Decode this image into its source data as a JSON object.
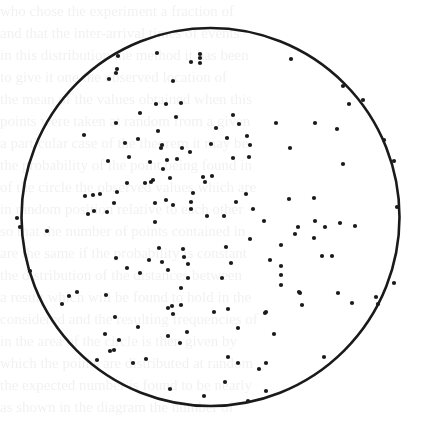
{
  "figure": {
    "circle": {
      "cx": 210.5,
      "cy": 217,
      "r": 189,
      "stroke": "#1a1a1a",
      "stroke_width": 2.6
    },
    "dot_color": "#1a1a1a",
    "dot_radius": 2.1,
    "points": [
      [
        118,
        56
      ],
      [
        117,
        69
      ],
      [
        116,
        73
      ],
      [
        109,
        79
      ],
      [
        157,
        53
      ],
      [
        191,
        62
      ],
      [
        200,
        54
      ],
      [
        200,
        58
      ],
      [
        200,
        63
      ],
      [
        173,
        81
      ],
      [
        156,
        104
      ],
      [
        166,
        104
      ],
      [
        181,
        103
      ],
      [
        140,
        113
      ],
      [
        176,
        117
      ],
      [
        291,
        59
      ],
      [
        343,
        86
      ],
      [
        363,
        100
      ],
      [
        349,
        104
      ],
      [
        233,
        115
      ],
      [
        239,
        124
      ],
      [
        216,
        128
      ],
      [
        276,
        123
      ],
      [
        315,
        123
      ],
      [
        337,
        129
      ],
      [
        247,
        136
      ],
      [
        227,
        138
      ],
      [
        250,
        145
      ],
      [
        384,
        140
      ],
      [
        290,
        148
      ],
      [
        84,
        135
      ],
      [
        116,
        123
      ],
      [
        125,
        143
      ],
      [
        138,
        139
      ],
      [
        158,
        131
      ],
      [
        162,
        145
      ],
      [
        161,
        148
      ],
      [
        182,
        148
      ],
      [
        190,
        152
      ],
      [
        211,
        144
      ],
      [
        108,
        161
      ],
      [
        129,
        157
      ],
      [
        150,
        162
      ],
      [
        167,
        160
      ],
      [
        177,
        159
      ],
      [
        163,
        169
      ],
      [
        170,
        178
      ],
      [
        127,
        183
      ],
      [
        145,
        183
      ],
      [
        151,
        182
      ],
      [
        153,
        180
      ],
      [
        203,
        177
      ],
      [
        212,
        176
      ],
      [
        205,
        182
      ],
      [
        93,
        195
      ],
      [
        100,
        194
      ],
      [
        85,
        196
      ],
      [
        117,
        192
      ],
      [
        88,
        214
      ],
      [
        94,
        211
      ],
      [
        107,
        212
      ],
      [
        114,
        203
      ],
      [
        155,
        203
      ],
      [
        166,
        200
      ],
      [
        173,
        205
      ],
      [
        191,
        202
      ],
      [
        191,
        209
      ],
      [
        193,
        193
      ],
      [
        207,
        216
      ],
      [
        233,
        158
      ],
      [
        249,
        157
      ],
      [
        343,
        164
      ],
      [
        394,
        161
      ],
      [
        246,
        194
      ],
      [
        236,
        202
      ],
      [
        289,
        199
      ],
      [
        314,
        198
      ],
      [
        253,
        209
      ],
      [
        224,
        216
      ],
      [
        264,
        221
      ],
      [
        315,
        221
      ],
      [
        298,
        227
      ],
      [
        325,
        227
      ],
      [
        355,
        226
      ],
      [
        340,
        223
      ],
      [
        397,
        207
      ],
      [
        17,
        218
      ],
      [
        20,
        227
      ],
      [
        47,
        231
      ],
      [
        155,
        222
      ],
      [
        159,
        248
      ],
      [
        149,
        260
      ],
      [
        183,
        249
      ],
      [
        184,
        257
      ],
      [
        188,
        264
      ],
      [
        168,
        270
      ],
      [
        162,
        262
      ],
      [
        140,
        273
      ],
      [
        116,
        258
      ],
      [
        127,
        268
      ],
      [
        188,
        278
      ],
      [
        181,
        288
      ],
      [
        172,
        306
      ],
      [
        173,
        314
      ],
      [
        62,
        304
      ],
      [
        69,
        296
      ],
      [
        77,
        292
      ],
      [
        106,
        295
      ],
      [
        30,
        271
      ],
      [
        115,
        317
      ],
      [
        226,
        247
      ],
      [
        250,
        239
      ],
      [
        281,
        245
      ],
      [
        295,
        234
      ],
      [
        314,
        238
      ],
      [
        322,
        256
      ],
      [
        332,
        256
      ],
      [
        231,
        263
      ],
      [
        270,
        260
      ],
      [
        281,
        266
      ],
      [
        281,
        275
      ],
      [
        281,
        285
      ],
      [
        222,
        278
      ],
      [
        299,
        292
      ],
      [
        338,
        293
      ],
      [
        352,
        303
      ],
      [
        376,
        297
      ],
      [
        378,
        304
      ],
      [
        394,
        283
      ],
      [
        302,
        305
      ],
      [
        228,
        309
      ],
      [
        266,
        312
      ],
      [
        214,
        312
      ],
      [
        238,
        328
      ],
      [
        105,
        334
      ],
      [
        119,
        340
      ],
      [
        110,
        351
      ],
      [
        114,
        350
      ],
      [
        97,
        360
      ],
      [
        133,
        363
      ],
      [
        146,
        359
      ],
      [
        138,
        327
      ],
      [
        168,
        308
      ],
      [
        181,
        305
      ],
      [
        168,
        336
      ],
      [
        187,
        332
      ],
      [
        180,
        343
      ],
      [
        228,
        357
      ],
      [
        238,
        363
      ],
      [
        265,
        313
      ],
      [
        274,
        334
      ],
      [
        266,
        363
      ],
      [
        259,
        369
      ],
      [
        225,
        382
      ],
      [
        266,
        391
      ],
      [
        170,
        389
      ],
      [
        204,
        396
      ],
      [
        248,
        401
      ],
      [
        300,
        293
      ],
      [
        324,
        357
      ]
    ]
  },
  "background": {
    "note": "faint illegible bleed-through text from scanned page",
    "lines": [
      "who chose the experiment a fraction of ",
      "and that the inter-arrival times of events",
      "in this distribution the method it has been",
      "to give it one the observed location of ",
      "the mean of the values obtained when this",
      "points were taken at random from a given",
      "a particular case of the theorem it may be",
      "the probability of the point being found in",
      "of the circle the observed values which are",
      "in random position relative to each other",
      "so that the number of points contained in",
      "are the same if the probability is constant",
      "the distribution of the distances between",
      "a result which will be found to hold in the",
      "considered and the resulting frequencies of",
      "in the area of the circle is then given by",
      "which the points are distributed at random",
      "the expected number is found to be nearly",
      "as shown in the diagram the number of"
    ]
  }
}
